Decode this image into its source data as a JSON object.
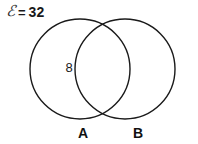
{
  "diagram": {
    "type": "venn-2-set",
    "title": "",
    "universal_set": {
      "symbol": "ℰ",
      "equals": "=",
      "total": "32"
    },
    "sets": [
      {
        "id": "A",
        "label": "A",
        "cx": 80,
        "cy": 69,
        "r": 50
      },
      {
        "id": "B",
        "label": "B",
        "cx": 125,
        "cy": 69,
        "r": 50
      }
    ],
    "regions": [
      {
        "id": "A-only",
        "value": "8"
      },
      {
        "id": "A-and-B",
        "value": ""
      },
      {
        "id": "B-only",
        "value": ""
      },
      {
        "id": "outside",
        "value": ""
      }
    ],
    "style": {
      "stroke": "#1a1a1a",
      "stroke_width": "1.4",
      "fill": "none",
      "background": "#ffffff"
    }
  }
}
